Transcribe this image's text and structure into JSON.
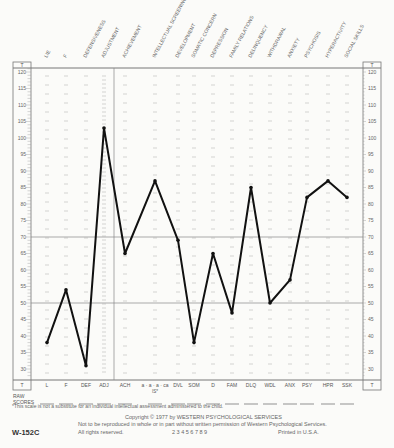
{
  "chart_data": {
    "type": "line",
    "ylabel": "T",
    "ylim": [
      27,
      122
    ],
    "yticks": [
      30,
      35,
      40,
      45,
      50,
      55,
      60,
      65,
      70,
      75,
      80,
      85,
      90,
      95,
      100,
      105,
      110,
      115,
      120
    ],
    "reference_lines": [
      70,
      50
    ],
    "scales": [
      {
        "abbr": "L",
        "name": "LIE",
        "t": 38
      },
      {
        "abbr": "F",
        "name": "F",
        "t": 54
      },
      {
        "abbr": "DEF",
        "name": "DEFENSIVENESS",
        "t": 31
      },
      {
        "abbr": "ADJ",
        "name": "ADJUSTMENT",
        "t": 103
      },
      {
        "abbr": "ACH",
        "name": "ACHIEVEMENT",
        "t": 65
      },
      {
        "abbr": "IS",
        "name": "INTELLECTUAL SCREENING",
        "t": 87
      },
      {
        "abbr": "DVL",
        "name": "DEVELOPMENT",
        "t": 69
      },
      {
        "abbr": "SOM",
        "name": "SOMATIC CONCERN",
        "t": 38
      },
      {
        "abbr": "D",
        "name": "DEPRESSION",
        "t": 65
      },
      {
        "abbr": "FAM",
        "name": "FAMILY RELATIONS",
        "t": 47
      },
      {
        "abbr": "DLQ",
        "name": "DELINQUENCY",
        "t": 85
      },
      {
        "abbr": "WDL",
        "name": "WITHDRAWAL",
        "t": 50
      },
      {
        "abbr": "ANX",
        "name": "ANXIETY",
        "t": 57
      },
      {
        "abbr": "PSY",
        "name": "PSYCHOSIS",
        "t": 82
      },
      {
        "abbr": "HPR",
        "name": "HYPERACTIVITY",
        "t": 87
      },
      {
        "abbr": "SSK",
        "name": "SOCIAL SKILLS",
        "t": 82
      }
    ],
    "grid": false,
    "legend": "none"
  },
  "labels": {
    "t_header": "T",
    "raw_scores": "RAW",
    "raw_scores2": "SCORES",
    "is_subs": "a  ·  a  ·  a  ·  ca",
    "is_note": "IS*",
    "footnote": "*This scale is not a substitute for an individual intellectual assessment administered to the child.",
    "copyright": "Copyright © 1977 by WESTERN PSYCHOLOGICAL SERVICES",
    "reproduction": "Not to be reproduced in whole or in part without written permission of Western Psychological Services.",
    "rights": "All rights reserved.",
    "printing": "2  3  4  5  6  7  8  9",
    "printed": "Printed in U.S.A.",
    "form_id": "W-152C"
  }
}
